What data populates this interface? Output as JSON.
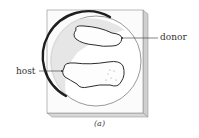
{
  "figure": {
    "type": "illustration",
    "labels": {
      "host": "host",
      "donor": "donor"
    },
    "caption": "(a)",
    "colors": {
      "dish_outline": "#2a2a2a",
      "plate_face": "#fbfbfb",
      "plate_edge": "#c8c8c8",
      "shadow": "#d9d9d9",
      "tissue_fill": "#fdfdfd",
      "line": "#333333"
    }
  }
}
